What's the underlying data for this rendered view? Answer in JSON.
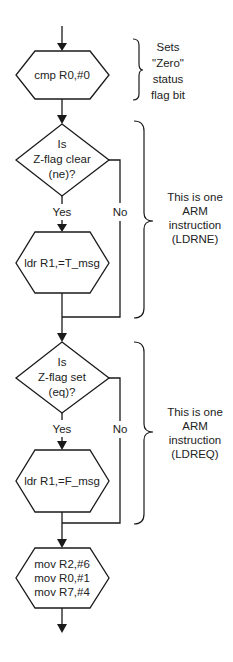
{
  "diagram": {
    "type": "flowchart",
    "nodes": {
      "cmp": {
        "kind": "process-hexagon",
        "lines": [
          "cmp R0,#0"
        ]
      },
      "decision_ne": {
        "kind": "decision-diamond",
        "lines": [
          "Is",
          "Z-flag clear",
          "(ne)?"
        ]
      },
      "ldr_t": {
        "kind": "process-hexagon",
        "lines": [
          "ldr R1,=T_msg"
        ]
      },
      "decision_eq": {
        "kind": "decision-diamond",
        "lines": [
          "Is",
          "Z-flag set",
          "(eq)?"
        ]
      },
      "ldr_f": {
        "kind": "process-hexagon",
        "lines": [
          "ldr R1,=F_msg"
        ]
      },
      "mov_block": {
        "kind": "process-hexagon",
        "lines": [
          "mov R2,#6",
          "mov R0,#1",
          "mov R7,#4"
        ]
      }
    },
    "edge_labels": {
      "ne_yes": "Yes",
      "ne_no": "No",
      "eq_yes": "Yes",
      "eq_no": "No"
    },
    "annotations": {
      "cmp_note": [
        "Sets",
        "\"Zero\"",
        "status",
        "flag bit"
      ],
      "ldrne_note": [
        "This is one",
        "ARM",
        "instruction",
        "(LDRNE)"
      ],
      "ldreq_note": [
        "This is one",
        "ARM",
        "instruction",
        "(LDREQ)"
      ]
    },
    "colors": {
      "stroke": "#1a1a1a",
      "text": "#222222",
      "background": "#ffffff"
    }
  }
}
